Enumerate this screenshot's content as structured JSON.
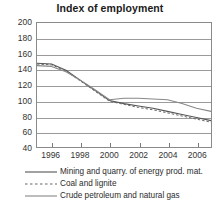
{
  "chart_data": {
    "type": "line",
    "title": "Index of employment",
    "xlabel": "",
    "ylabel": "",
    "xlim": [
      1995,
      2007
    ],
    "ylim": [
      40,
      200
    ],
    "ytick_labels": [
      "200",
      "180",
      "160",
      "140",
      "120",
      "100",
      "80",
      "60",
      "40"
    ],
    "ytick_values": [
      200,
      180,
      160,
      140,
      120,
      100,
      80,
      60,
      40
    ],
    "xtick_labels": [
      "1996",
      "1998",
      "2000",
      "2002",
      "2004",
      "2006"
    ],
    "xtick_values": [
      1996,
      1998,
      2000,
      2002,
      2004,
      2006
    ],
    "grid": true,
    "legend_position": "below",
    "x": [
      1995,
      1996,
      1997,
      1998,
      1999,
      2000,
      2001,
      2002,
      2003,
      2004,
      2005,
      2006,
      2007
    ],
    "series": [
      {
        "name": "Mining and quarry. of energy prod. mat.",
        "style": "solid",
        "color": "#555555",
        "values": [
          148,
          147,
          139,
          126,
          113,
          100,
          96,
          93,
          90,
          86,
          82,
          78,
          74
        ]
      },
      {
        "name": "Coal and lignite",
        "style": "dashed",
        "color": "#666666",
        "values": [
          147,
          146,
          138,
          125,
          112,
          99,
          95,
          91,
          88,
          84,
          80,
          76,
          72
        ]
      },
      {
        "name": "Crude petroleum and natural gas",
        "style": "solid",
        "color": "#888888",
        "values": [
          145,
          144,
          137,
          126,
          114,
          101,
          103,
          103,
          102,
          101,
          96,
          90,
          86
        ]
      }
    ]
  }
}
